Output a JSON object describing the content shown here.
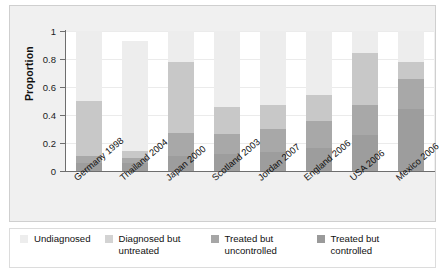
{
  "chart_data": {
    "type": "bar",
    "subtype": "stacked-bar",
    "title": "",
    "xlabel": "",
    "ylabel": "Proportion",
    "ylim": [
      0,
      1
    ],
    "yticks": [
      "0",
      "0.2",
      "0.4",
      "0.6",
      "0.8",
      "1"
    ],
    "ytick_values": [
      0,
      0.2,
      0.4,
      0.6,
      0.8,
      1
    ],
    "grid": true,
    "legend_position": "bottom",
    "categories": [
      "Germany 1998",
      "Thailand 2004",
      "Japan 2000",
      "Scotland 2003",
      "Jordan 2007",
      "England 2006",
      "USA 2006",
      "Mexico 2006"
    ],
    "series": [
      {
        "name": "Treated but controlled",
        "color": "#9d9d9d",
        "values": [
          0.055,
          0.055,
          0.105,
          0.12,
          0.135,
          0.165,
          0.255,
          0.44
        ]
      },
      {
        "name": "Treated but uncontrolled",
        "color": "#a8a8a8",
        "values": [
          0.055,
          0.04,
          0.165,
          0.145,
          0.165,
          0.195,
          0.215,
          0.215
        ]
      },
      {
        "name": "Diagnosed but untreated",
        "color": "#c8c8c8",
        "values": [
          0.39,
          0.045,
          0.51,
          0.195,
          0.175,
          0.18,
          0.37,
          0.125
        ]
      },
      {
        "name": "Undiagnosed",
        "color": "#ededed",
        "values": [
          0.5,
          0.79,
          0.22,
          0.54,
          0.525,
          0.46,
          0.16,
          0.22
        ]
      }
    ],
    "bar_totals_visible": [
      0.5,
      0.21,
      0.78,
      0.46,
      0.475,
      0.54,
      0.84,
      0.78
    ]
  },
  "legend": {
    "items": [
      {
        "label": "Undiagnosed",
        "color": "#ededed"
      },
      {
        "label": "Diagnosed but untreated",
        "color": "#d3d3d3"
      },
      {
        "label": "Treated but uncontrolled",
        "color": "#a6a6a6"
      },
      {
        "label": "Treated but controlled",
        "color": "#9a9a9a"
      }
    ]
  },
  "colors": {
    "panel_background": "#f0f0f0",
    "plot_background": "#ffffff",
    "axis": "#6e6e6e",
    "grid": "#ebebeb",
    "text": "#111111"
  }
}
